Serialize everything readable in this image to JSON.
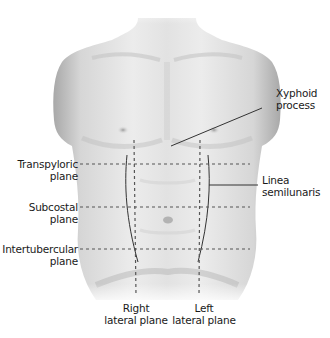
{
  "diagram": {
    "labels": {
      "xyphoid": [
        "Xyphoid",
        "process"
      ],
      "transpyloric": [
        "Transpyloric",
        "plane"
      ],
      "subcostal": [
        "Subcostal",
        "plane"
      ],
      "intertubercular": [
        "Intertubercular",
        "plane"
      ],
      "linea_semilunaris": [
        "Linea",
        "semilunaris"
      ],
      "right_lateral": [
        "Right",
        "lateral plane"
      ],
      "left_lateral": [
        "Left",
        "lateral plane"
      ]
    },
    "planes": {
      "transpyloric_y": 164,
      "subcostal_y": 207,
      "intertubercular_y": 249,
      "right_lateral_x": 134,
      "left_lateral_x": 200
    },
    "colors": {
      "skin_light": "#f2f2f2",
      "skin_mid": "#cfcfcf",
      "skin_dark": "#9a9a9a",
      "line": "#333333",
      "dash": "#555555"
    }
  }
}
